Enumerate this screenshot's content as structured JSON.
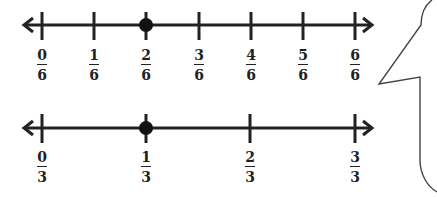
{
  "number_lines": [
    {
      "id": "sixths",
      "denominator": 6,
      "labels": [
        {
          "num": "0",
          "den": "6"
        },
        {
          "num": "1",
          "den": "6"
        },
        {
          "num": "2",
          "den": "6"
        },
        {
          "num": "3",
          "den": "6"
        },
        {
          "num": "4",
          "den": "6"
        },
        {
          "num": "5",
          "den": "6"
        },
        {
          "num": "6",
          "den": "6"
        }
      ],
      "marked_point": {
        "num": "2",
        "den": "6"
      }
    },
    {
      "id": "thirds",
      "denominator": 3,
      "labels": [
        {
          "num": "0",
          "den": "3"
        },
        {
          "num": "1",
          "den": "3"
        },
        {
          "num": "2",
          "den": "3"
        },
        {
          "num": "3",
          "den": "3"
        }
      ],
      "marked_point": {
        "num": "1",
        "den": "3"
      }
    }
  ],
  "speech_bubble": {
    "text": ""
  },
  "colors": {
    "line": "#222222",
    "bubble_outline": "#444444",
    "background": "#ffffff"
  }
}
